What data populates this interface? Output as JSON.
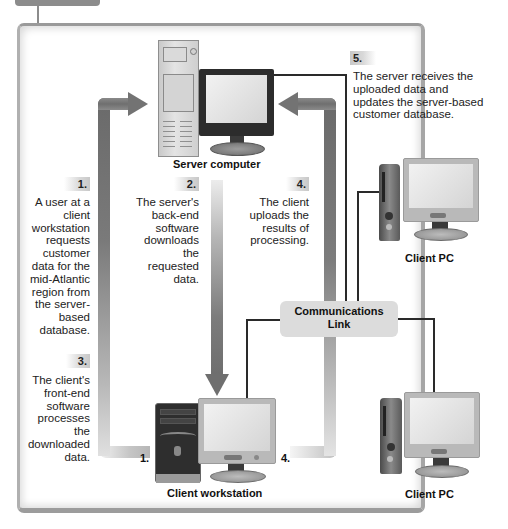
{
  "diagram": {
    "nodes": {
      "server": {
        "label": "Server computer"
      },
      "workstation": {
        "label": "Client workstation"
      },
      "client_pc_1": {
        "label": "Client PC"
      },
      "client_pc_2": {
        "label": "Client PC"
      },
      "comm_link": {
        "line1": "Communications",
        "line2": "Link"
      }
    },
    "steps": [
      {
        "num": "1.",
        "lines": [
          "A user at a",
          "client",
          "workstation",
          "requests",
          "customer",
          "data for the",
          "mid-Atlantic",
          "region from",
          "the server-",
          "based",
          "database."
        ]
      },
      {
        "num": "2.",
        "lines": [
          "The server's",
          "back-end",
          "software",
          "downloads",
          "the",
          "requested",
          "data."
        ]
      },
      {
        "num": "3.",
        "lines": [
          "The client's",
          "front-end",
          "software",
          "processes",
          "the",
          "downloaded",
          "data."
        ]
      },
      {
        "num": "4.",
        "lines": [
          "The client",
          "uploads the",
          "results of",
          "processing."
        ]
      },
      {
        "num": "5.",
        "lines": [
          "The server receives the",
          "uploaded data and",
          "updates the server-based",
          "customer database."
        ]
      }
    ],
    "arrow_markers": {
      "left_bottom": "1.",
      "right_bottom": "4."
    },
    "colors": {
      "arrow": "#737373",
      "panel_border": "#9c9c9c",
      "comm_link_bg": "#dcdcdc",
      "wire": "#2a2a2a"
    }
  }
}
